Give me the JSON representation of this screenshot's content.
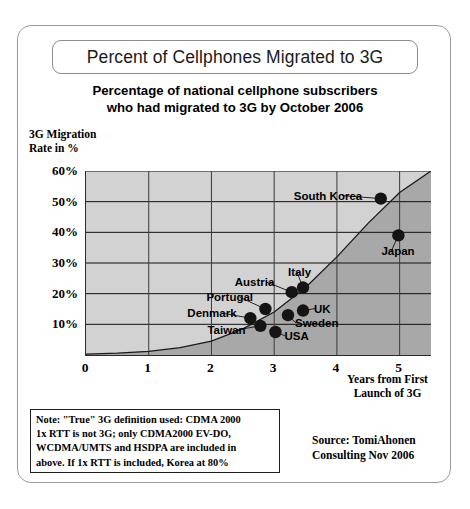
{
  "title": "Percent of Cellphones Migrated to 3G",
  "subtitle_line1": "Percentage of national cellphone subscribers",
  "subtitle_line2": "who had migrated to 3G by October 2006",
  "y_caption_line1": "3G Migration",
  "y_caption_line2": "Rate in %",
  "x_caption_line1": "Years from First",
  "x_caption_line2": "Launch of 3G",
  "note": {
    "line1": "Note: \"True\" 3G definition used: CDMA 2000",
    "line2": "1x RTT is not 3G; only CDMA2000 EV-DO,",
    "line3": "WCDMA/UMTS and HSDPA are included in",
    "line4": "above. If 1x RTT is included, Korea at 80%"
  },
  "source": {
    "line1": "Source: TomiAhonen",
    "line2": "Consulting Nov 2006"
  },
  "colors": {
    "plot_background_above": "#d2d2d2",
    "plot_background_below": "#a8a8a8",
    "axis": "#2a2a2a",
    "gridline": "#111111",
    "marker": "#141414",
    "frame": "#9a9a9a"
  },
  "chart_data": {
    "type": "scatter",
    "title": "Percent of Cellphones Migrated to 3G",
    "subtitle": "Percentage of national cellphone subscribers who had migrated to 3G by October 2006",
    "xlabel": "Years from First Launch of 3G",
    "ylabel": "3G Migration Rate in %",
    "xlim": [
      0,
      5.5
    ],
    "ylim": [
      0,
      60
    ],
    "xticks": [
      0,
      1,
      2,
      3,
      4,
      5
    ],
    "xtick_labels": [
      "0",
      "1",
      "2",
      "3",
      "4",
      "5"
    ],
    "yticks": [
      10,
      20,
      30,
      40,
      50,
      60
    ],
    "ytick_labels": [
      "10%",
      "20%",
      "30%",
      "40%",
      "50%",
      "60%"
    ],
    "grid": true,
    "legend": false,
    "points": [
      {
        "label": "Denmark",
        "x": 2.62,
        "y": 12.0,
        "label_dx": -62,
        "label_dy": -5
      },
      {
        "label": "Taiwan",
        "x": 2.78,
        "y": 9.5,
        "label_dx": -52,
        "label_dy": 4
      },
      {
        "label": "Portugal",
        "x": 2.86,
        "y": 15.0,
        "label_dx": -58,
        "label_dy": -12
      },
      {
        "label": "USA",
        "x": 3.02,
        "y": 7.5,
        "label_dx": 10,
        "label_dy": 4
      },
      {
        "label": "Austria",
        "x": 3.28,
        "y": 20.5,
        "label_dx": -56,
        "label_dy": -10
      },
      {
        "label": "Sweden",
        "x": 3.22,
        "y": 13.0,
        "label_dx": 8,
        "label_dy": 8
      },
      {
        "label": "Italy",
        "x": 3.46,
        "y": 22.0,
        "label_dx": -14,
        "label_dy": -16
      },
      {
        "label": "UK",
        "x": 3.46,
        "y": 14.5,
        "label_dx": 12,
        "label_dy": -2
      },
      {
        "label": "South Korea",
        "x": 4.7,
        "y": 51.0,
        "label_dx": -86,
        "label_dy": -3
      },
      {
        "label": "Japan",
        "x": 4.98,
        "y": 39.0,
        "label_dx": -16,
        "label_dy": 16
      }
    ],
    "trend_curve": [
      {
        "x": 0.0,
        "y": 0.3
      },
      {
        "x": 0.5,
        "y": 0.6
      },
      {
        "x": 1.0,
        "y": 1.2
      },
      {
        "x": 1.5,
        "y": 2.4
      },
      {
        "x": 2.0,
        "y": 4.5
      },
      {
        "x": 2.5,
        "y": 8.5
      },
      {
        "x": 3.0,
        "y": 14.0
      },
      {
        "x": 3.5,
        "y": 22.0
      },
      {
        "x": 4.0,
        "y": 32.0
      },
      {
        "x": 4.5,
        "y": 43.0
      },
      {
        "x": 5.0,
        "y": 53.0
      },
      {
        "x": 5.5,
        "y": 60.0
      }
    ]
  }
}
